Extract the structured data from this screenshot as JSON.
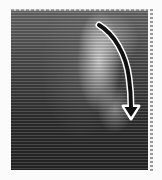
{
  "image": {
    "description": "Grayscale scan-line image with bright curved region on upper right and a curved downward-pointing black arrow with white outline",
    "frame": {
      "x": 11,
      "y": 9,
      "width": 137,
      "height": 161
    },
    "colors": {
      "background": "#fbfbfb",
      "image_top": "#6a6a6a",
      "image_bottom": "#262626",
      "highlight": "#e1e1e1",
      "arrow_fill": "#111111",
      "arrow_outline": "#ffffff",
      "ruler": "#9c9c9c"
    }
  },
  "annotations": [
    {
      "type": "arrow",
      "icon": "curved-arrow-down-icon",
      "direction": "down",
      "path_points": [
        [
          99,
          25
        ],
        [
          118,
          45
        ],
        [
          128,
          75
        ],
        [
          131,
          108
        ]
      ],
      "tip": [
        131,
        118
      ]
    }
  ]
}
